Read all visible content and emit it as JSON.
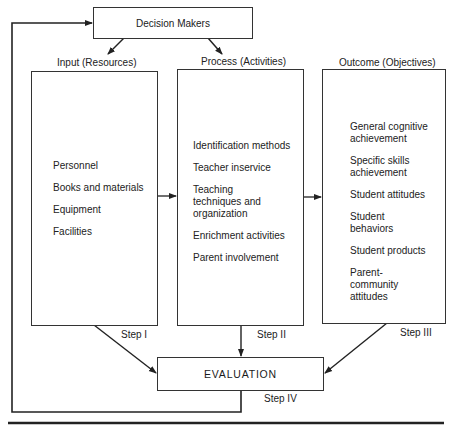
{
  "decision_makers": {
    "label": "Decision Makers"
  },
  "input": {
    "title": "Input (Resources)",
    "items": [
      "Personnel",
      "Books and materials",
      "Equipment",
      "Facilities"
    ],
    "step": "Step I"
  },
  "process": {
    "title": "Process (Activities)",
    "items": [
      "Identification methods",
      "Teacher inservice",
      "Teaching techniques and organization",
      "Enrichment activities",
      "Parent involvement"
    ],
    "step": "Step II"
  },
  "outcome": {
    "title": "Outcome (Objectives)",
    "items": [
      "General cognitive achievement",
      "Specific skills achievement",
      "Student attitudes",
      "Student behaviors",
      "Student products",
      "Parent-community attitudes"
    ],
    "step": "Step III"
  },
  "evaluation": {
    "label": "EVALUATION",
    "step": "Step IV"
  }
}
